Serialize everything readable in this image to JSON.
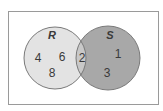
{
  "diagram": {
    "type": "venn",
    "sets": [
      {
        "name": "R",
        "label": "R",
        "fill": "#e3e3e3",
        "only_elements": [
          "4",
          "6",
          "8"
        ]
      },
      {
        "name": "S",
        "label": "S",
        "fill": "#a8a8a8",
        "only_elements": [
          "1",
          "3"
        ]
      }
    ],
    "intersection": {
      "elements": [
        "2"
      ],
      "fill": "#c8c8c8"
    },
    "outline_color": "#7a7a7a",
    "frame_color": "#9a9a9a",
    "labels": {
      "r": "R",
      "s": "S",
      "r4": "4",
      "r6": "6",
      "r8": "8",
      "i2": "2",
      "s1": "1",
      "s3": "3"
    }
  }
}
